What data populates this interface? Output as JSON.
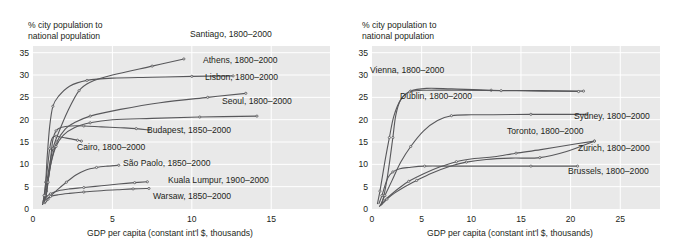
{
  "figure": {
    "cut_off_header": "",
    "panels": [
      {
        "id": "left",
        "y_axis_title": "% city population to\nnational population",
        "x_axis_title": "GDP per capita (constant int'l $, thousands)",
        "y_ticks": [
          "0",
          "5",
          "10",
          "15",
          "20",
          "25",
          "30",
          "35"
        ],
        "x_ticks": [
          "0",
          "5",
          "10",
          "15"
        ],
        "labels": [
          "Santiago, 1800–2000",
          "Athens, 1800–2000",
          "Lisbon, 1800–2000",
          "Seoul, 1800–2000",
          "Budapest, 1850–2000",
          "Cairo, 1800–2000",
          "São Paolo, 1850–2000",
          "Kuala Lumpur, 1900–2000",
          "Warsaw, 1850–2000"
        ]
      },
      {
        "id": "right",
        "y_axis_title": "% city population to\nnational population",
        "x_axis_title": "GDP per capita (constant int'l $, thousands)",
        "y_ticks": [
          "0",
          "5",
          "10",
          "15",
          "20",
          "25",
          "30",
          "35"
        ],
        "x_ticks": [
          "0",
          "5",
          "10",
          "15",
          "20",
          "25"
        ],
        "labels": [
          "Vienna, 1800–2000",
          "Dublin, 1800–2000",
          "Sydney, 1800–2000",
          "Toronto, 1800–2000",
          "Zurich, 1800–2000",
          "Brussels, 1800–2000"
        ]
      }
    ]
  },
  "colors": {
    "plot_background": "#e9e9e9",
    "gridline": "#ffffff",
    "series_line": "#58585b",
    "text": "#231f20"
  },
  "chart_data": [
    {
      "type": "line",
      "panel": "left",
      "title": "",
      "xlabel": "GDP per capita (constant int'l $, thousands)",
      "ylabel": "% city population to national population",
      "xlim": [
        0,
        18.7
      ],
      "ylim": [
        0,
        36.5
      ],
      "xticks": [
        0,
        5,
        10,
        15
      ],
      "yticks": [
        0,
        5,
        10,
        15,
        20,
        25,
        30,
        35
      ],
      "grid": true,
      "legend": "inline-labels",
      "series": [
        {
          "name": "Santiago, 1800–2000",
          "label": "Santiago, 1800–2000",
          "points": [
            [
              0.62,
              1.4
            ],
            [
              0.72,
              3.0
            ],
            [
              0.85,
              5.5
            ],
            [
              1.0,
              9.0
            ],
            [
              1.25,
              13.5
            ],
            [
              1.6,
              17.0
            ],
            [
              2.2,
              22.0
            ],
            [
              2.9,
              26.5
            ],
            [
              3.6,
              28.4
            ],
            [
              5.0,
              30.0
            ],
            [
              7.5,
              32.0
            ],
            [
              9.5,
              33.6
            ]
          ]
        },
        {
          "name": "Athens, 1800–2000",
          "label": "Athens, 1800–2000",
          "points": [
            [
              0.7,
              2.0
            ],
            [
              0.8,
              6.0
            ],
            [
              0.9,
              12.0
            ],
            [
              1.05,
              18.5
            ],
            [
              1.25,
              23.0
            ],
            [
              1.6,
              25.2
            ],
            [
              2.3,
              27.5
            ],
            [
              3.4,
              28.8
            ],
            [
              5.0,
              29.3
            ],
            [
              7.5,
              29.5
            ],
            [
              10.0,
              29.7
            ],
            [
              12.6,
              29.8
            ]
          ]
        },
        {
          "name": "Lisbon, 1800–2000",
          "label": "Lisbon, 1800–2000",
          "points": [
            [
              0.72,
              1.8
            ],
            [
              0.85,
              4.0
            ],
            [
              1.0,
              7.5
            ],
            [
              1.2,
              11.5
            ],
            [
              1.5,
              15.0
            ],
            [
              2.0,
              17.8
            ],
            [
              2.6,
              19.3
            ],
            [
              3.6,
              20.8
            ],
            [
              5.5,
              22.3
            ],
            [
              8.0,
              23.8
            ],
            [
              11.0,
              25.0
            ],
            [
              13.4,
              25.9
            ]
          ]
        },
        {
          "name": "Seoul, 1800–2000",
          "label": "Seoul, 1800–2000",
          "points": [
            [
              0.68,
              1.2
            ],
            [
              0.8,
              3.0
            ],
            [
              0.95,
              6.5
            ],
            [
              1.15,
              10.5
            ],
            [
              1.45,
              14.0
            ],
            [
              1.9,
              16.5
            ],
            [
              2.6,
              18.2
            ],
            [
              3.6,
              19.3
            ],
            [
              5.0,
              20.0
            ],
            [
              7.5,
              20.3
            ],
            [
              10.5,
              20.6
            ],
            [
              14.1,
              20.8
            ]
          ]
        },
        {
          "name": "Budapest, 1850–2000",
          "label": "Budapest, 1850–2000",
          "points": [
            [
              0.8,
              2.2
            ],
            [
              0.95,
              6.0
            ],
            [
              1.1,
              11.0
            ],
            [
              1.25,
              15.5
            ],
            [
              1.45,
              17.5
            ],
            [
              1.8,
              18.3
            ],
            [
              2.4,
              18.6
            ],
            [
              3.2,
              18.6
            ],
            [
              4.3,
              18.4
            ],
            [
              5.5,
              18.2
            ],
            [
              6.5,
              18.0
            ],
            [
              7.3,
              17.7
            ]
          ]
        },
        {
          "name": "Cairo, 1800–2000",
          "label": "Cairo, 1800–2000",
          "points": [
            [
              0.6,
              1.0
            ],
            [
              0.7,
              3.0
            ],
            [
              0.82,
              6.5
            ],
            [
              0.95,
              10.5
            ],
            [
              1.05,
              13.5
            ],
            [
              1.15,
              15.3
            ],
            [
              1.25,
              16.1
            ],
            [
              1.45,
              16.3
            ],
            [
              1.9,
              16.0
            ],
            [
              2.4,
              15.7
            ],
            [
              2.8,
              15.4
            ],
            [
              3.05,
              15.2
            ]
          ]
        },
        {
          "name": "São Paolo, 1850–2000",
          "label": "São Paolo, 1850–2000",
          "points": [
            [
              0.75,
              1.2
            ],
            [
              0.95,
              2.2
            ],
            [
              1.2,
              3.2
            ],
            [
              1.6,
              4.5
            ],
            [
              2.1,
              6.0
            ],
            [
              2.7,
              7.6
            ],
            [
              3.3,
              8.7
            ],
            [
              4.0,
              9.3
            ],
            [
              4.7,
              9.6
            ],
            [
              5.4,
              9.8
            ]
          ]
        },
        {
          "name": "Kuala Lumpur, 1900–2000",
          "label": "Kuala Lumpur, 1900–2000",
          "points": [
            [
              0.8,
              2.6
            ],
            [
              1.1,
              3.4
            ],
            [
              1.6,
              4.1
            ],
            [
              2.3,
              4.5
            ],
            [
              3.2,
              4.8
            ],
            [
              4.3,
              5.2
            ],
            [
              5.4,
              5.6
            ],
            [
              6.4,
              5.9
            ],
            [
              7.2,
              6.1
            ]
          ]
        },
        {
          "name": "Warsaw, 1850–2000",
          "label": "Warsaw, 1850–2000",
          "points": [
            [
              0.78,
              2.0
            ],
            [
              1.1,
              2.8
            ],
            [
              1.6,
              3.2
            ],
            [
              2.3,
              3.5
            ],
            [
              3.2,
              3.8
            ],
            [
              4.3,
              4.1
            ],
            [
              5.3,
              4.3
            ],
            [
              6.3,
              4.5
            ],
            [
              7.3,
              4.6
            ]
          ]
        }
      ]
    },
    {
      "type": "line",
      "panel": "right",
      "title": "",
      "xlabel": "GDP per capita (constant int'l $, thousands)",
      "ylabel": "% city population to national population",
      "xlim": [
        0,
        29
      ],
      "ylim": [
        0,
        36.5
      ],
      "xticks": [
        0,
        5,
        10,
        15,
        20,
        25
      ],
      "yticks": [
        0,
        5,
        10,
        15,
        20,
        25,
        30,
        35
      ],
      "grid": true,
      "legend": "inline-labels",
      "series": [
        {
          "name": "Vienna, 1800–2000",
          "label": "Vienna, 1800–2000",
          "points": [
            [
              0.55,
              1.2
            ],
            [
              0.8,
              4.0
            ],
            [
              1.05,
              7.3
            ],
            [
              1.35,
              11.3
            ],
            [
              1.75,
              16.0
            ],
            [
              2.2,
              20.8
            ],
            [
              2.9,
              24.5
            ],
            [
              3.9,
              26.4
            ],
            [
              5.5,
              27.0
            ],
            [
              8.0,
              26.9
            ],
            [
              12.0,
              26.6
            ],
            [
              17.0,
              26.5
            ],
            [
              21.3,
              26.4
            ]
          ]
        },
        {
          "name": "Dublin, 1800–2000",
          "label": "Dublin, 1800–2000",
          "points": [
            [
              0.95,
              1.0
            ],
            [
              1.2,
              3.0
            ],
            [
              1.5,
              6.5
            ],
            [
              1.8,
              11.0
            ],
            [
              2.1,
              16.0
            ],
            [
              2.4,
              21.0
            ],
            [
              2.9,
              24.5
            ],
            [
              3.8,
              26.2
            ],
            [
              5.5,
              26.6
            ],
            [
              8.5,
              26.6
            ],
            [
              13.0,
              26.5
            ],
            [
              17.5,
              26.4
            ],
            [
              20.8,
              26.3
            ]
          ]
        },
        {
          "name": "Sydney, 1800–2000",
          "label": "Sydney, 1800–2000",
          "points": [
            [
              0.85,
              0.8
            ],
            [
              1.3,
              3.0
            ],
            [
              2.0,
              6.3
            ],
            [
              2.9,
              10.5
            ],
            [
              3.9,
              14.0
            ],
            [
              5.2,
              17.5
            ],
            [
              6.6,
              19.8
            ],
            [
              8.0,
              20.9
            ],
            [
              10.0,
              21.1
            ],
            [
              12.2,
              21.1
            ],
            [
              16.0,
              21.2
            ],
            [
              19.0,
              21.2
            ],
            [
              21.6,
              21.2
            ]
          ]
        },
        {
          "name": "Toronto, 1800–2000",
          "label": "Toronto, 1800–2000",
          "points": [
            [
              0.75,
              0.6
            ],
            [
              1.2,
              1.8
            ],
            [
              1.9,
              3.2
            ],
            [
              2.8,
              4.8
            ],
            [
              3.7,
              6.2
            ],
            [
              5.2,
              7.9
            ],
            [
              6.8,
              9.4
            ],
            [
              8.5,
              10.6
            ],
            [
              10.3,
              11.3
            ],
            [
              12.3,
              11.7
            ],
            [
              14.5,
              12.5
            ],
            [
              17.0,
              13.3
            ],
            [
              20.0,
              14.4
            ],
            [
              22.4,
              15.2
            ]
          ]
        },
        {
          "name": "Zurich, 1800–2000",
          "label": "Zurich, 1800–2000",
          "points": [
            [
              0.95,
              0.9
            ],
            [
              1.5,
              2.2
            ],
            [
              2.3,
              3.6
            ],
            [
              3.3,
              5.0
            ],
            [
              4.5,
              6.4
            ],
            [
              6.0,
              8.0
            ],
            [
              7.8,
              9.5
            ],
            [
              9.5,
              10.5
            ],
            [
              11.5,
              11.1
            ],
            [
              14.0,
              11.4
            ],
            [
              16.9,
              11.5
            ],
            [
              19.5,
              12.8
            ],
            [
              22.4,
              15.2
            ]
          ]
        },
        {
          "name": "Brussels, 1800–2000",
          "label": "Brussels, 1800–2000",
          "points": [
            [
              0.7,
              1.2
            ],
            [
              1.0,
              3.0
            ],
            [
              1.3,
              5.2
            ],
            [
              1.6,
              7.0
            ],
            [
              2.1,
              8.3
            ],
            [
              2.8,
              9.0
            ],
            [
              3.7,
              9.3
            ],
            [
              5.3,
              9.6
            ],
            [
              8.0,
              9.6
            ],
            [
              12.0,
              9.6
            ],
            [
              16.0,
              9.6
            ],
            [
              20.7,
              9.6
            ]
          ]
        }
      ]
    }
  ],
  "label_placements": {
    "left": [
      {
        "text": "Santiago, 1800–2000",
        "x": 190,
        "y": 37,
        "anchor": "start"
      },
      {
        "text": "Athens, 1800–2000",
        "x": 203,
        "y": 63,
        "anchor": "start"
      },
      {
        "text": "Lisbon, 1800–2000",
        "x": 205,
        "y": 80,
        "anchor": "start"
      },
      {
        "text": "Seoul, 1800–2000",
        "x": 222,
        "y": 104,
        "anchor": "start"
      },
      {
        "text": "Budapest, 1850–2000",
        "x": 147,
        "y": 133,
        "anchor": "start"
      },
      {
        "text": "Cairo, 1800–2000",
        "x": 77,
        "y": 150,
        "anchor": "start"
      },
      {
        "text": "São Paolo, 1850–2000",
        "x": 123,
        "y": 166,
        "anchor": "start"
      },
      {
        "text": "Kuala Lumpur, 1900–2000",
        "x": 168,
        "y": 183,
        "anchor": "start"
      },
      {
        "text": "Warsaw, 1850–2000",
        "x": 153,
        "y": 199,
        "anchor": "start"
      }
    ],
    "right": [
      {
        "text": "Vienna, 1800–2000",
        "x": 30,
        "y": 73,
        "anchor": "start"
      },
      {
        "text": "Dublin, 1800–2000",
        "x": 60,
        "y": 99,
        "anchor": "start"
      },
      {
        "text": "Sydney, 1800–2000",
        "x": 234,
        "y": 119,
        "anchor": "start"
      },
      {
        "text": "Toronto, 1800–2000",
        "x": 167,
        "y": 134,
        "anchor": "start"
      },
      {
        "text": "Zurich, 1800–2000",
        "x": 238,
        "y": 151,
        "anchor": "start"
      },
      {
        "text": "Brussels, 1800–2000",
        "x": 228,
        "y": 174,
        "anchor": "start"
      }
    ]
  }
}
